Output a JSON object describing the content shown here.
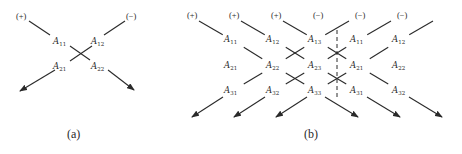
{
  "figure_a": {
    "caption": "(a)",
    "plus": "(+)",
    "minus": "(−)",
    "entries": [
      {
        "base": "A",
        "sub": "11",
        "x": 62,
        "y": 42
      },
      {
        "base": "A",
        "sub": "12",
        "x": 98,
        "y": 42
      },
      {
        "base": "A",
        "sub": "21",
        "x": 62,
        "y": 67
      },
      {
        "base": "A",
        "sub": "22",
        "x": 98,
        "y": 67
      }
    ]
  },
  "figure_b": {
    "caption": "(b)",
    "plus_labels": [
      "(+)",
      "(+)",
      "(+)"
    ],
    "minus_labels": [
      "(−)",
      "(−)",
      "(−)"
    ],
    "rows": [
      [
        "11",
        "12",
        "13",
        "11",
        "12"
      ],
      [
        "21",
        "22",
        "23",
        "21",
        "22"
      ],
      [
        "31",
        "32",
        "33",
        "31",
        "32"
      ]
    ],
    "base": "A"
  }
}
